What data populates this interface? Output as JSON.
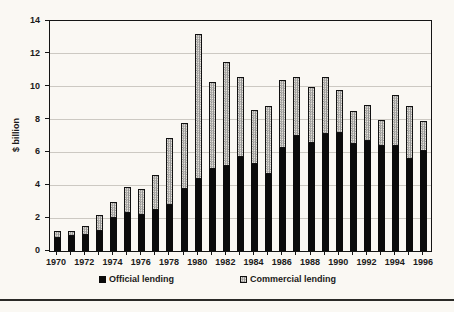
{
  "page": {
    "background": "#faf8f3",
    "rule_color": "#2b2a27"
  },
  "chart_data": {
    "type": "bar",
    "stacked": true,
    "title": "",
    "xlabel": "",
    "ylabel": "$ billion",
    "ylim": [
      0,
      14
    ],
    "yticks": [
      0,
      2,
      4,
      6,
      8,
      10,
      12,
      14
    ],
    "grid": true,
    "legend_position": "bottom",
    "xtick_label_every": 2,
    "categories": [
      "1970",
      "1971",
      "1972",
      "1973",
      "1974",
      "1975",
      "1976",
      "1977",
      "1978",
      "1979",
      "1980",
      "1981",
      "1982",
      "1983",
      "1984",
      "1985",
      "1986",
      "1987",
      "1988",
      "1989",
      "1990",
      "1991",
      "1992",
      "1993",
      "1994",
      "1995",
      "1996"
    ],
    "series": [
      {
        "name": "Official lending",
        "style": "solid",
        "color": "#0b0b0b",
        "values": [
          0.8,
          0.9,
          1.0,
          1.2,
          2.0,
          2.3,
          2.2,
          2.5,
          2.8,
          3.8,
          4.4,
          5.0,
          5.2,
          5.7,
          5.3,
          4.7,
          6.3,
          7.0,
          6.6,
          7.1,
          7.2,
          6.5,
          6.7,
          6.4,
          6.4,
          5.6,
          6.1
        ]
      },
      {
        "name": "Commercial lending",
        "style": "dotted-hatch",
        "color": "#8e8e8e",
        "values": [
          0.4,
          0.3,
          0.5,
          1.0,
          1.0,
          1.6,
          1.6,
          2.1,
          4.1,
          4.0,
          8.8,
          5.3,
          6.3,
          4.9,
          3.3,
          4.1,
          4.1,
          3.6,
          3.4,
          3.5,
          2.6,
          2.0,
          2.2,
          1.6,
          3.1,
          3.2,
          1.8
        ]
      }
    ]
  }
}
